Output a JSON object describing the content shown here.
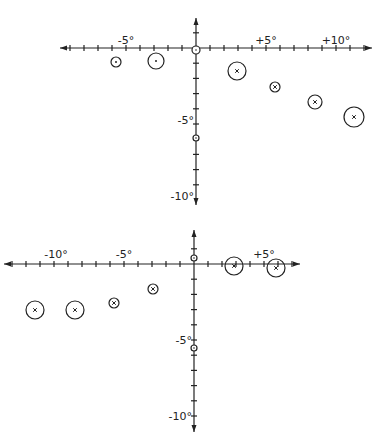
{
  "diagrams": [
    {
      "name": "top-plot",
      "origin": [
        196,
        48
      ],
      "scale_px_per_deg": 14,
      "x_labels": [
        {
          "text": "-5°",
          "x": 126,
          "y": 44
        },
        {
          "text": "+5°",
          "x": 266,
          "y": 44
        },
        {
          "text": "+10°",
          "x": 336,
          "y": 44
        }
      ],
      "y_labels": [
        {
          "text": "-5°",
          "x": 196,
          "y": 124
        },
        {
          "text": "-10°",
          "x": 196,
          "y": 200
        }
      ],
      "points": [
        {
          "cx": 116,
          "cy": 62,
          "r": 5,
          "mark": "dot"
        },
        {
          "cx": 156,
          "cy": 61,
          "r": 8,
          "mark": "dot"
        },
        {
          "cx": 237,
          "cy": 71,
          "r": 9,
          "mark": "x"
        },
        {
          "cx": 275,
          "cy": 87,
          "r": 5,
          "mark": "x"
        },
        {
          "cx": 315,
          "cy": 102,
          "r": 7,
          "mark": "x"
        },
        {
          "cx": 354,
          "cy": 117,
          "r": 10,
          "mark": "x"
        }
      ],
      "axis_markers": [
        {
          "cx": 196,
          "cy": 50,
          "r": 4
        },
        {
          "cx": 196,
          "cy": 138,
          "r": 3
        }
      ]
    },
    {
      "name": "bottom-plot",
      "origin": [
        194,
        264
      ],
      "scale_px_per_deg": 14,
      "x_labels": [
        {
          "text": "-10°",
          "x": 56,
          "y": 258
        },
        {
          "text": "-5°",
          "x": 124,
          "y": 258
        },
        {
          "text": "+5°",
          "x": 264,
          "y": 258
        }
      ],
      "y_labels": [
        {
          "text": "-5°",
          "x": 194,
          "y": 344
        },
        {
          "text": "-10°",
          "x": 194,
          "y": 420
        }
      ],
      "points": [
        {
          "cx": 35,
          "cy": 310,
          "r": 9,
          "mark": "x"
        },
        {
          "cx": 75,
          "cy": 310,
          "r": 9,
          "mark": "x"
        },
        {
          "cx": 114,
          "cy": 303,
          "r": 5,
          "mark": "x"
        },
        {
          "cx": 153,
          "cy": 289,
          "r": 5,
          "mark": "x"
        },
        {
          "cx": 234,
          "cy": 266,
          "r": 9,
          "mark": "x"
        },
        {
          "cx": 276,
          "cy": 268,
          "r": 9,
          "mark": "x"
        }
      ],
      "axis_markers": [
        {
          "cx": 194,
          "cy": 258,
          "r": 3
        },
        {
          "cx": 194,
          "cy": 348,
          "r": 3
        }
      ]
    }
  ]
}
